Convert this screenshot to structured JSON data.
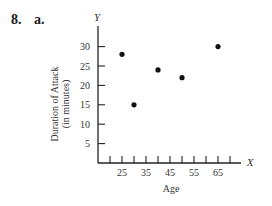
{
  "problem": {
    "number": "8.",
    "part": "a."
  },
  "chart_data": {
    "type": "scatter",
    "title": "",
    "xlabel": "Age",
    "ylabel": "Duration of Attack (in minutes)",
    "ylabel_lines": [
      "Duration of Attack",
      "(in minutes)"
    ],
    "x_axis_letter": "X",
    "y_axis_letter": "Y",
    "xlim": [
      15,
      75
    ],
    "ylim": [
      0,
      34
    ],
    "x_ticks": [
      20,
      25,
      30,
      35,
      40,
      45,
      50,
      55,
      60,
      65,
      70
    ],
    "x_tick_labels": [
      "25",
      "35",
      "45",
      "55",
      "65"
    ],
    "x_tick_label_values": [
      25,
      35,
      45,
      55,
      65
    ],
    "y_ticks": [
      5,
      10,
      15,
      20,
      25,
      30
    ],
    "y_tick_labels": [
      "5",
      "10",
      "15",
      "20",
      "25",
      "30"
    ],
    "grid": false,
    "legend": null,
    "points": [
      {
        "x": 25,
        "y": 28
      },
      {
        "x": 30,
        "y": 15
      },
      {
        "x": 40,
        "y": 24
      },
      {
        "x": 50,
        "y": 22
      },
      {
        "x": 65,
        "y": 30
      }
    ]
  }
}
